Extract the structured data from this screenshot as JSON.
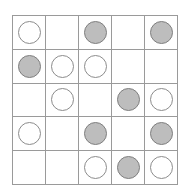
{
  "grid": {
    "rows": 5,
    "cols": 5,
    "colors": {
      "grid_line": "#9a9a9a",
      "filled": "#bdbdbd",
      "filled_border": "#7f7f7f",
      "open_border": "#8c8c8c",
      "background": "#ffffff"
    },
    "legend": {
      "E": "empty",
      "O": "open-circle",
      "F": "filled-circle"
    },
    "cells": [
      [
        "O",
        "E",
        "F",
        "E",
        "F"
      ],
      [
        "F",
        "O",
        "O",
        "E",
        "E"
      ],
      [
        "E",
        "O",
        "E",
        "F",
        "O"
      ],
      [
        "O",
        "E",
        "F",
        "E",
        "F"
      ],
      [
        "E",
        "E",
        "O",
        "F",
        "O"
      ]
    ]
  }
}
